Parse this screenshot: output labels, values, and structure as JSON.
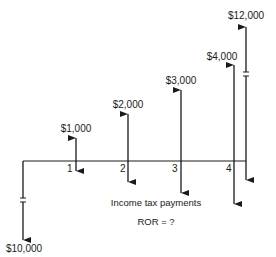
{
  "diagram": {
    "type": "cash-flow-diagram",
    "initial_investment": {
      "period": 0,
      "label": "$10,000",
      "direction": "down",
      "broken_axis": true
    },
    "periods": [
      {
        "period": 1,
        "period_label": "1",
        "receipt_label": "$1,000"
      },
      {
        "period": 2,
        "period_label": "2",
        "receipt_label": "$2,000"
      },
      {
        "period": 3,
        "period_label": "3",
        "receipt_label": "$3,000"
      },
      {
        "period": 4,
        "period_label": "4",
        "receipt_label": "$4,000"
      }
    ],
    "salvage": {
      "period": 4,
      "label": "$12,000",
      "direction": "up",
      "broken_axis": true
    },
    "annotation": "Income tax payments",
    "question": "ROR = ?",
    "colors": {
      "line": "#1a1a1a",
      "background": "#ffffff"
    }
  }
}
